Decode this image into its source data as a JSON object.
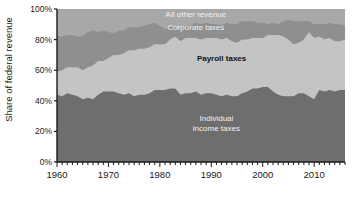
{
  "chart_data": {
    "type": "area",
    "stacked": true,
    "title": "",
    "subtitle": "",
    "xlabel": "",
    "ylabel": "Share of federal revenue",
    "xlim": [
      1960,
      2016
    ],
    "ylim": [
      0,
      100
    ],
    "grid": false,
    "legend_position": "inline-labels",
    "xticks": [
      1960,
      1970,
      1980,
      1990,
      2000,
      2010
    ],
    "xtick_labels": [
      "1960",
      "1970",
      "1980",
      "1990",
      "2000",
      "2010"
    ],
    "minor_xtick_interval": 1,
    "yticks": [
      0,
      20,
      40,
      60,
      80,
      100
    ],
    "ytick_labels": [
      "0%",
      "20%",
      "40%",
      "60%",
      "80%",
      "100%"
    ],
    "annotations": [
      {
        "text": "All other revenue",
        "series": "All other revenue",
        "x": 1987,
        "y": 95
      },
      {
        "text": "Corporate taxes",
        "series": "Corporate taxes",
        "x": 1987,
        "y": 86
      },
      {
        "text": "Payroll taxes",
        "series": "Payroll taxes",
        "x": 1992,
        "y": 66
      },
      {
        "text": "Individual",
        "series": "Individual income taxes",
        "x": 1991,
        "y": 27
      },
      {
        "text": "income taxes",
        "series": "Individual income taxes",
        "x": 1991,
        "y": 20
      }
    ],
    "colors": {
      "individual_income_taxes": "#6e6e6e",
      "payroll_taxes": "#c4c4c4",
      "corporate_taxes": "#8f8f8f",
      "all_other_revenue": "#a8a8a8",
      "plot_background": "#9a9a9a",
      "axis": "#1a1a1a",
      "label_light": "#f2f2f2",
      "label_dark": "#111111"
    },
    "x": [
      1960,
      1961,
      1962,
      1963,
      1964,
      1965,
      1966,
      1967,
      1968,
      1969,
      1970,
      1971,
      1972,
      1973,
      1974,
      1975,
      1976,
      1977,
      1978,
      1979,
      1980,
      1981,
      1982,
      1983,
      1984,
      1985,
      1986,
      1987,
      1988,
      1989,
      1990,
      1991,
      1992,
      1993,
      1994,
      1995,
      1996,
      1997,
      1998,
      1999,
      2000,
      2001,
      2002,
      2003,
      2004,
      2005,
      2006,
      2007,
      2008,
      2009,
      2010,
      2011,
      2012,
      2013,
      2014,
      2015,
      2016
    ],
    "series": [
      {
        "name": "Individual income taxes",
        "color": "#6e6e6e",
        "values": [
          44,
          43,
          45,
          44,
          43,
          41,
          42,
          41,
          44,
          46,
          46,
          46,
          45,
          44,
          45,
          43,
          44,
          44,
          45,
          47,
          47,
          47,
          48,
          48,
          44,
          45,
          45,
          46,
          44,
          45,
          45,
          44,
          43,
          44,
          43,
          43,
          45,
          46,
          48,
          48,
          49,
          49,
          46,
          44,
          43,
          43,
          43,
          45,
          45,
          43,
          41,
          47,
          46,
          47,
          46,
          47,
          47
        ]
      },
      {
        "name": "Payroll taxes",
        "color": "#c4c4c4",
        "values": [
          15,
          17,
          17,
          18,
          19,
          19,
          20,
          22,
          22,
          20,
          22,
          24,
          25,
          27,
          28,
          30,
          30,
          30,
          30,
          30,
          30,
          30,
          32,
          34,
          35,
          36,
          36,
          35,
          36,
          36,
          36,
          37,
          37,
          37,
          36,
          35,
          35,
          34,
          33,
          33,
          32,
          34,
          37,
          39,
          39,
          37,
          34,
          33,
          35,
          42,
          40,
          35,
          34,
          34,
          33,
          32,
          33
        ]
      },
      {
        "name": "Corporate taxes",
        "color": "#8f8f8f",
        "values": [
          23,
          22,
          21,
          21,
          20,
          22,
          23,
          23,
          19,
          20,
          17,
          14,
          16,
          15,
          15,
          15,
          14,
          15,
          15,
          14,
          12,
          10,
          8,
          6,
          8,
          8,
          8,
          10,
          10,
          10,
          9,
          9,
          9,
          10,
          11,
          12,
          12,
          12,
          11,
          10,
          10,
          7,
          8,
          7,
          10,
          13,
          15,
          14,
          12,
          7,
          9,
          8,
          10,
          10,
          11,
          11,
          9
        ]
      },
      {
        "name": "All other revenue",
        "color": "#a8a8a8",
        "values": [
          18,
          18,
          17,
          17,
          18,
          18,
          15,
          14,
          15,
          14,
          15,
          16,
          14,
          14,
          12,
          12,
          12,
          11,
          10,
          9,
          11,
          13,
          12,
          12,
          13,
          11,
          11,
          9,
          10,
          9,
          10,
          10,
          11,
          9,
          10,
          10,
          8,
          8,
          8,
          9,
          9,
          10,
          9,
          10,
          8,
          7,
          8,
          8,
          8,
          8,
          10,
          10,
          10,
          9,
          10,
          10,
          11
        ]
      }
    ]
  }
}
